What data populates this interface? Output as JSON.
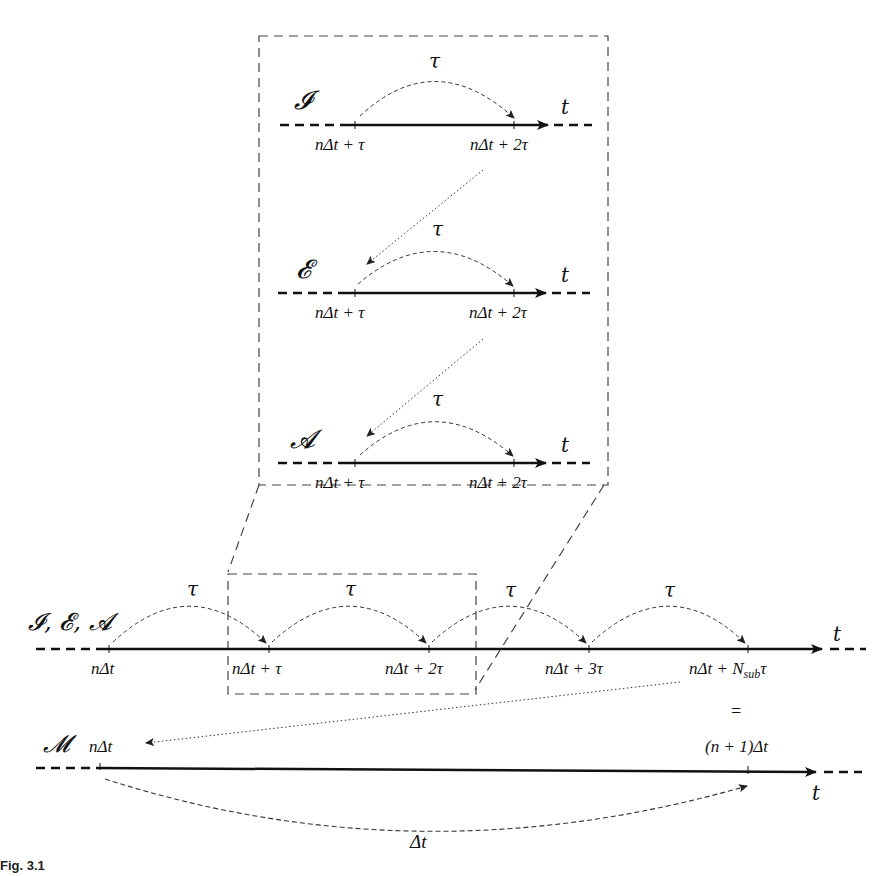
{
  "figure": {
    "zoom_box": {
      "rows": [
        {
          "id": "I",
          "label": "𝓘",
          "step": "τ",
          "axis": "t",
          "ticks": [
            "nΔt + τ",
            "nΔt + 2τ"
          ]
        },
        {
          "id": "E",
          "label": "𝓔",
          "step": "τ",
          "axis": "t",
          "ticks": [
            "nΔt + τ",
            "nΔt + 2τ"
          ]
        },
        {
          "id": "A",
          "label": "𝓐",
          "step": "τ",
          "axis": "t",
          "ticks": [
            "nΔt + τ",
            "nΔt + 2τ"
          ]
        }
      ]
    },
    "sub_timeline": {
      "label": "𝓘, 𝓔, 𝓐",
      "axis": "t",
      "steps": [
        "τ",
        "τ",
        "τ",
        "τ"
      ],
      "ticks": [
        "nΔt",
        "nΔt + τ",
        "nΔt + 2τ",
        "nΔt + 3τ",
        "nΔt + N_sub τ"
      ],
      "tick_last_main": "nΔt + N",
      "tick_last_sub": "sub",
      "tick_last_tail": "τ"
    },
    "equals": "=",
    "macro_timeline": {
      "label": "𝓜",
      "start": "nΔt",
      "end": "(n + 1)Δt",
      "axis": "t",
      "step": "Δt"
    }
  },
  "caption": "Fig. 3.1"
}
